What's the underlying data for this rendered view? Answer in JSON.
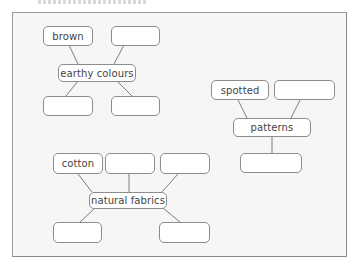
{
  "title_fragment": "",
  "diagram": {
    "groups": [
      {
        "center": "earthy colours",
        "nodes": [
          "brown",
          "",
          "",
          ""
        ]
      },
      {
        "center": "patterns",
        "nodes": [
          "spotted",
          "",
          ""
        ]
      },
      {
        "center": "natural fabrics",
        "nodes": [
          "cotton",
          "",
          "",
          "",
          ""
        ]
      }
    ]
  },
  "colors": {
    "frame_background": "#f6f6f6",
    "box_border": "#8c8c8c",
    "text": "#444444"
  }
}
